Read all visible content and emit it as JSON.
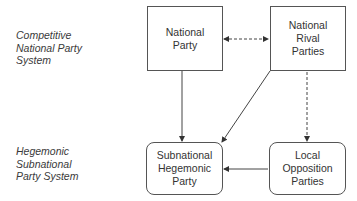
{
  "row_labels": {
    "top": "Competitive\nNational Party\nSystem",
    "bottom": "Hegemonic\nSubnational\nParty System"
  },
  "nodes": {
    "national_party": "National\nParty",
    "national_rival_parties": "National\nRival\nParties",
    "subnational_hegemonic_party": "Subnational\nHegemonic\nParty",
    "local_opposition_parties": "Local\nOpposition\nParties"
  },
  "edges": [
    {
      "from": "national_party",
      "to": "national_rival_parties",
      "style": "dashed",
      "direction": "both"
    },
    {
      "from": "national_party",
      "to": "subnational_hegemonic_party",
      "style": "solid",
      "direction": "forward"
    },
    {
      "from": "national_rival_parties",
      "to": "subnational_hegemonic_party",
      "style": "solid",
      "direction": "forward"
    },
    {
      "from": "national_rival_parties",
      "to": "local_opposition_parties",
      "style": "dashed",
      "direction": "forward"
    },
    {
      "from": "local_opposition_parties",
      "to": "subnational_hegemonic_party",
      "style": "solid",
      "direction": "forward"
    }
  ]
}
